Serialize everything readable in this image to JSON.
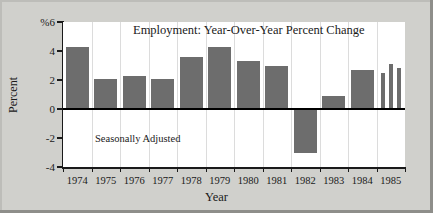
{
  "chart_data": {
    "type": "bar",
    "title": "Employment: Year-Over-Year Percent Change",
    "annotation": "Seasonally Adjusted",
    "xlabel": "Year",
    "ylabel": "Percent",
    "unit_marker": "%",
    "categories": [
      "1974",
      "1975",
      "1976",
      "1977",
      "1978",
      "1979",
      "1980",
      "1981",
      "1982",
      "1983",
      "1984",
      "1985"
    ],
    "values": [
      4.3,
      2.1,
      2.3,
      2.1,
      3.6,
      4.3,
      3.3,
      3.0,
      -3.0,
      0.9,
      2.7,
      null
    ],
    "sub_series": {
      "category": "1985",
      "note": "1985 shown as three narrow period bars",
      "values": [
        2.5,
        3.1,
        2.8
      ]
    },
    "ylim": [
      -4,
      6
    ],
    "yticks": [
      6,
      4,
      2,
      0,
      -2,
      -4
    ],
    "ytick_labels": [
      "%6",
      "4",
      "2",
      "0",
      "-2",
      "-4"
    ],
    "grid": "vertical",
    "legend": "none",
    "bar_color": "#6d6d6d",
    "axis_color": "#1a1a1a",
    "plot_background": "#ffffff",
    "figure_background": "#d0d0cc"
  }
}
